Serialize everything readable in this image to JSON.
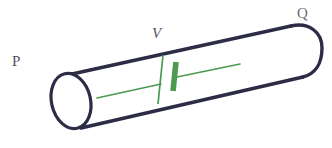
{
  "figure": {
    "kind": "physics-diagram",
    "background_color": "#ffffff",
    "width": 332,
    "height": 148
  },
  "tube": {
    "name": "cylindrical-tube",
    "stroke_color": "#2c2c47",
    "stroke_width": 3.2,
    "fill_color": "#ffffff",
    "open_end_label": "P",
    "closed_end_label": "Q"
  },
  "labels": {
    "left_terminal": "P",
    "right_terminal": "Q",
    "voltage": "V"
  },
  "circuit": {
    "name": "cell-symbol",
    "color": "#4b9a4f",
    "bar_color": "#4b9a4f",
    "lead_width": 1.6,
    "plate_width": 5.5,
    "voltage_label": "V"
  },
  "colors": {
    "tube_outline": "#2c2c47",
    "circuit_green": "#4b9a4f",
    "label_gray": "#53525f",
    "label_gray_light": "#6d6c78",
    "background": "#ffffff"
  }
}
